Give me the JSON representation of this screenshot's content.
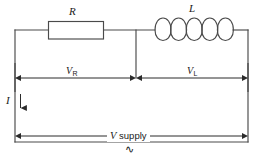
{
  "diagram": {
    "background_color": "#ffffff",
    "line_color": "#3a3a3a",
    "text_color": "#1a1a1a",
    "components": {
      "resistor": {
        "symbol": "R",
        "type": "resistor-box"
      },
      "inductor": {
        "symbol": "L",
        "type": "inductor-coil",
        "coil_count": 5
      }
    },
    "labels": {
      "resistor_label": "R",
      "inductor_label": "L",
      "current_label": "I",
      "voltage_resistor": "V",
      "voltage_resistor_sub": "R",
      "voltage_inductor": "V",
      "voltage_inductor_sub": "L",
      "supply_prefix": "V",
      "supply_text": " supply",
      "ac_symbol": "∿"
    },
    "measures": [
      {
        "name": "V_R",
        "span": "resistor-branch",
        "arrow": "double-headed"
      },
      {
        "name": "V_L",
        "span": "inductor-branch",
        "arrow": "double-headed"
      },
      {
        "name": "V supply",
        "span": "full-loop",
        "arrow": "double-headed"
      },
      {
        "name": "I",
        "span": "left-wire",
        "arrow": "single-down"
      }
    ]
  }
}
